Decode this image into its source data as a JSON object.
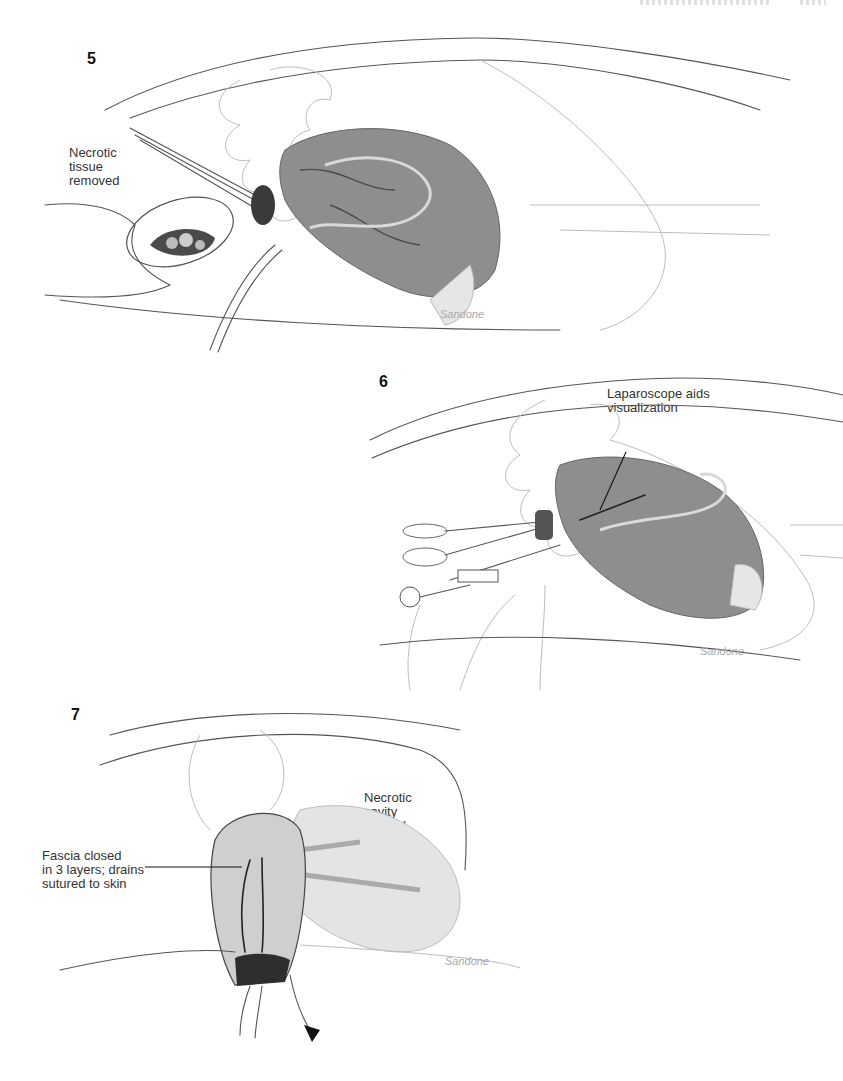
{
  "page": {
    "running_head_fragment": "",
    "running_head_note": "clipped at top edge; illegible"
  },
  "figures": [
    {
      "number": "5",
      "callouts": [
        {
          "id": "necrotic-tissue-removed",
          "text": "Necrotic\ntissue\nremoved"
        }
      ],
      "signature": "Sandone"
    },
    {
      "number": "6",
      "callouts": [
        {
          "id": "laparoscope-aids-visualization",
          "text": "Laparoscope aids\nvisualization"
        }
      ],
      "signature": "Sandone"
    },
    {
      "number": "7",
      "callouts": [
        {
          "id": "necrotic-cavity-flushed",
          "text": "Necrotic\ncavity\nflushed"
        },
        {
          "id": "fascia-closed",
          "text": "Fascia closed\nin 3 layers; drains\nsutured to skin"
        }
      ],
      "signature": "Sandone"
    }
  ],
  "colors": {
    "necrotic_cavity": "#8e8e8e",
    "cavity_flushed": "#e4e4e4",
    "line_art": "#555555",
    "label_text": "#333333"
  }
}
